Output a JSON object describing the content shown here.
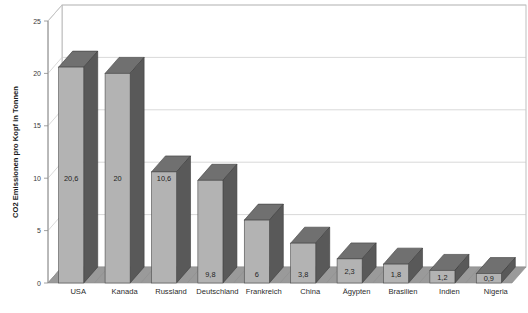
{
  "chart_data": {
    "type": "bar",
    "title": "",
    "xlabel": "",
    "ylabel": "CO2 Emissionen pro Kopf in Tonnen",
    "categories": [
      "USA",
      "Kanada",
      "Russland",
      "Deutschland",
      "Frankreich",
      "China",
      "Ägypten",
      "Brasilien",
      "Indien",
      "Nigeria"
    ],
    "values": [
      20.6,
      20,
      10.6,
      9.8,
      6,
      3.8,
      2.3,
      1.8,
      1.2,
      0.9
    ],
    "value_labels": [
      "20,6",
      "20",
      "10,6",
      "9,8",
      "6",
      "3,8",
      "2,3",
      "1,8",
      "1,2",
      "0,9"
    ],
    "ylim": [
      0,
      25
    ],
    "yticks": [
      0,
      5,
      10,
      15,
      20,
      25
    ],
    "ytick_labels": [
      "0",
      "5",
      "10",
      "15",
      "20",
      "25"
    ],
    "grid": true,
    "legend": false,
    "style": "3d-column",
    "colors": {
      "bar_front": "#b3b3b3",
      "bar_side": "#595959",
      "bar_top": "#707070",
      "floor": "#9a9a9a",
      "wall": "#ffffff",
      "gridline": "#c9c9c9",
      "text": "#2b2b2b"
    }
  }
}
